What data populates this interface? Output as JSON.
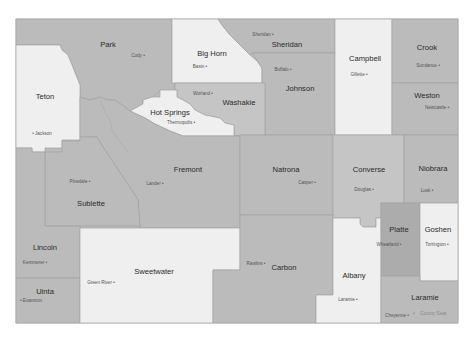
{
  "map": {
    "colors": {
      "light": "#efefef",
      "mid": "#bbbbbb",
      "midlight": "#c5c5c5",
      "dark": "#acacac",
      "border": "#a3a3a3"
    },
    "counties": {
      "park": {
        "name": "Park",
        "seat": "Cody •"
      },
      "teton": {
        "name": "Teton",
        "seat": "• Jackson"
      },
      "big_horn": {
        "name": "Big Horn",
        "seat": "Basin •"
      },
      "sheridan": {
        "name": "Sheridan",
        "seat": "Sheridan •"
      },
      "johnson": {
        "name": "Johnson",
        "seat": "Buffalo •"
      },
      "campbell": {
        "name": "Campbell",
        "seat": "Gillette •"
      },
      "crook": {
        "name": "Crook",
        "seat": "Sundance •"
      },
      "weston": {
        "name": "Weston",
        "seat": "Newcastle •"
      },
      "washakie": {
        "name": "Washakie",
        "seat": "Worland •"
      },
      "hot_springs": {
        "name": "Hot Springs",
        "seat": "Thermopolis •"
      },
      "fremont": {
        "name": "Fremont",
        "seat": "Lander •"
      },
      "sublette": {
        "name": "Sublette",
        "seat": "Pinedale •"
      },
      "natrona": {
        "name": "Natrona",
        "seat": "Casper •"
      },
      "converse": {
        "name": "Converse",
        "seat": "Douglas •"
      },
      "niobrara": {
        "name": "Niobrara",
        "seat": "Lusk •"
      },
      "lincoln": {
        "name": "Lincoln",
        "seat": "Kemmerer •"
      },
      "uinta": {
        "name": "Uinta",
        "seat": "• Evanston"
      },
      "sweetwater": {
        "name": "Sweetwater",
        "seat": "Green River •"
      },
      "carbon": {
        "name": "Carbon",
        "seat": "Rawlins •"
      },
      "albany": {
        "name": "Albany",
        "seat": "Laramie •"
      },
      "platte": {
        "name": "Platte",
        "seat": "Wheatland •"
      },
      "goshen": {
        "name": "Goshen",
        "seat": "Torrington •"
      },
      "laramie": {
        "name": "Laramie",
        "seat": "Cheyenne •"
      }
    },
    "legend": {
      "marker": "•",
      "label": "County Seat"
    }
  }
}
